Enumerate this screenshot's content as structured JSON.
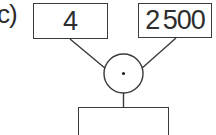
{
  "diagram": {
    "part_label": "c)",
    "operator": {
      "symbol": "·",
      "meaning": "multiplication"
    },
    "inputs": [
      {
        "value": "4"
      },
      {
        "value": "2 500"
      }
    ],
    "result": {
      "value": ""
    }
  },
  "colors": {
    "stroke": "#3a3a3a",
    "text": "#2e2e2e",
    "background": "#ffffff"
  }
}
